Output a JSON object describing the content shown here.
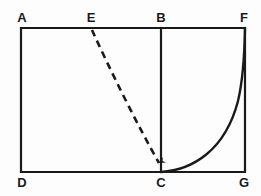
{
  "figure": {
    "kind": "geometry-diagram",
    "background_color": "#fdfdfd",
    "stroke_color": "#1a1a1a",
    "labels": [
      {
        "name": "A",
        "text": "A",
        "x": 22,
        "y": 11,
        "position": "top-left-corner"
      },
      {
        "name": "E",
        "text": "E",
        "x": 91,
        "y": 11,
        "position": "top-edge-midpoint-left"
      },
      {
        "name": "B",
        "text": "B",
        "x": 161,
        "y": 11,
        "position": "top-edge-at-vertical-divider"
      },
      {
        "name": "F",
        "text": "F",
        "x": 244,
        "y": 11,
        "position": "top-right-corner"
      },
      {
        "name": "D",
        "text": "D",
        "x": 22,
        "y": 176,
        "position": "bottom-left-corner"
      },
      {
        "name": "C",
        "text": "C",
        "x": 161,
        "y": 176,
        "position": "bottom-edge-at-vertical-divider"
      },
      {
        "name": "G",
        "text": "G",
        "x": 244,
        "y": 176,
        "position": "bottom-right-corner"
      }
    ],
    "points": {
      "A": {
        "x": 21,
        "y": 28
      },
      "E": {
        "x": 92,
        "y": 29
      },
      "B": {
        "x": 161,
        "y": 28
      },
      "F": {
        "x": 245,
        "y": 28
      },
      "D": {
        "x": 21,
        "y": 172
      },
      "C": {
        "x": 161,
        "y": 172
      },
      "G": {
        "x": 245,
        "y": 172
      }
    },
    "shapes": {
      "rectangle": {
        "name": "outer-rectangle",
        "path": "M 21 28 L 245 28 L 245 172 L 21 172 Z",
        "stroke_width": 2.2,
        "style": "solid"
      },
      "divider": {
        "name": "segment-BC",
        "path": "M 161 28 L 161 172",
        "stroke_width": 2.2,
        "style": "solid"
      },
      "dashed_segment": {
        "name": "segment-EC-dashed",
        "path": "M 92 30 C 112 74, 138 126, 160 166",
        "stroke_width": 2.6,
        "style": "dashed",
        "dash_pattern": "7 5",
        "arrowhead": "at-C"
      },
      "curve": {
        "name": "exponential-curve-CF",
        "path": "M 161 172 C 191 170, 224 150, 238 100 C 243 80, 244.5 50, 245 28",
        "stroke_width": 2.4,
        "style": "solid",
        "from": "C",
        "to": "F"
      }
    }
  }
}
